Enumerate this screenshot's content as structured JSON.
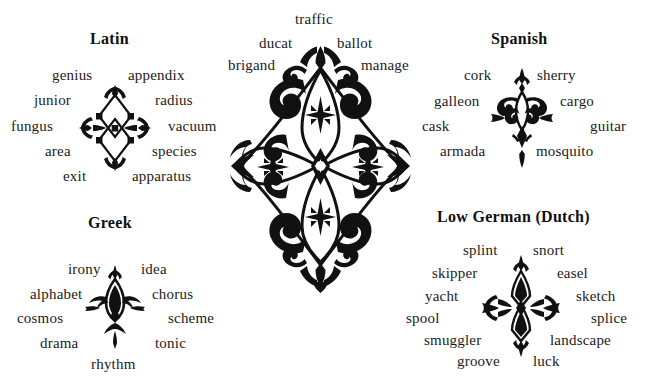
{
  "page": {
    "background_color": "#ffffff",
    "text_color": "#1b1b1b",
    "width": 645,
    "height": 380
  },
  "groups": {
    "latin": {
      "heading": "Latin",
      "ornament_name": "latin-ornament",
      "words_left": [
        "genius",
        "junior",
        "fungus",
        "area",
        "exit"
      ],
      "words_right": [
        "appendix",
        "radius",
        "vacuum",
        "species",
        "apparatus"
      ]
    },
    "spanish": {
      "heading": "Spanish",
      "ornament_name": "spanish-ornament",
      "words_left": [
        "cork",
        "galleon",
        "cask",
        "armada"
      ],
      "words_right": [
        "sherry",
        "cargo",
        "guitar",
        "mosquito"
      ]
    },
    "greek": {
      "heading": "Greek",
      "ornament_name": "greek-ornament",
      "words_left": [
        "irony",
        "alphabet",
        "cosmos",
        "drama"
      ],
      "words_right": [
        "idea",
        "chorus",
        "scheme",
        "tonic"
      ],
      "words_bottom": [
        "rhythm"
      ]
    },
    "low_german": {
      "heading": "Low German (Dutch)",
      "ornament_name": "low-german-ornament",
      "words_left": [
        "splint",
        "skipper",
        "yacht",
        "spool",
        "smuggler",
        "groove"
      ],
      "words_right": [
        "snort",
        "easel",
        "sketch",
        "splice",
        "landscape",
        "luck"
      ]
    },
    "center": {
      "heading": "",
      "ornament_name": "center-ornament",
      "words_top": [
        "traffic"
      ],
      "words_left": [
        "ducat",
        "brigand"
      ],
      "words_right": [
        "ballot",
        "manage"
      ]
    }
  },
  "words": {
    "latin_0": "genius",
    "latin_1": "junior",
    "latin_2": "fungus",
    "latin_3": "area",
    "latin_4": "exit",
    "latin_5": "appendix",
    "latin_6": "radius",
    "latin_7": "vacuum",
    "latin_8": "species",
    "latin_9": "apparatus",
    "spanish_0": "cork",
    "spanish_1": "galleon",
    "spanish_2": "cask",
    "spanish_3": "armada",
    "spanish_4": "sherry",
    "spanish_5": "cargo",
    "spanish_6": "guitar",
    "spanish_7": "mosquito",
    "greek_0": "irony",
    "greek_1": "alphabet",
    "greek_2": "cosmos",
    "greek_3": "drama",
    "greek_4": "idea",
    "greek_5": "chorus",
    "greek_6": "scheme",
    "greek_7": "tonic",
    "greek_8": "rhythm",
    "german_0": "splint",
    "german_1": "skipper",
    "german_2": "yacht",
    "german_3": "spool",
    "german_4": "smuggler",
    "german_5": "groove",
    "german_6": "snort",
    "german_7": "easel",
    "german_8": "sketch",
    "german_9": "splice",
    "german_10": "landscape",
    "german_11": "luck",
    "center_0": "traffic",
    "center_1": "ducat",
    "center_2": "ballot",
    "center_3": "brigand",
    "center_4": "manage"
  },
  "headings": {
    "latin": "Latin",
    "spanish": "Spanish",
    "greek": "Greek",
    "low_german": "Low German (Dutch)"
  }
}
